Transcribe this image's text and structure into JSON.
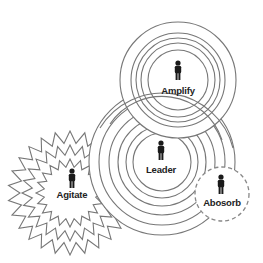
{
  "nodes": [
    {
      "id": "amplify",
      "label": "Amplify",
      "shape": "concentric-circles"
    },
    {
      "id": "leader",
      "label": "Leader",
      "shape": "concentric-circles"
    },
    {
      "id": "agitate",
      "label": "Agitate",
      "shape": "concentric-starbursts"
    },
    {
      "id": "absorb",
      "label": "Abosorb",
      "shape": "dashed-circle"
    }
  ],
  "icons": {
    "person": "person-icon"
  },
  "colors": {
    "stroke": "#777777",
    "label": "#222222",
    "background": "#ffffff"
  }
}
